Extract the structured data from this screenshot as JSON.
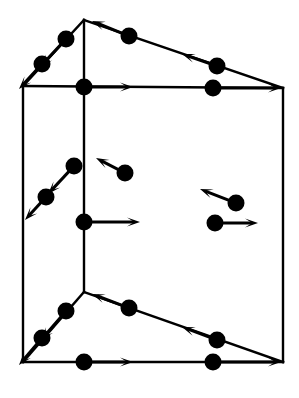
{
  "figure": {
    "type": "line-diagram",
    "width": 299,
    "height": 398,
    "background_color": "#ffffff",
    "stroke_color": "#000000",
    "node_color": "#000000",
    "edge_stroke_width": 2.4,
    "node_radius": 8.5,
    "arrow_head_length": 13,
    "arrow_head_width": 9
  },
  "vertices": [
    {
      "name": "top-apex",
      "x": 84,
      "y": 20
    },
    {
      "name": "top-left-corner",
      "x": 23,
      "y": 86
    },
    {
      "name": "top-right-corner",
      "x": 283,
      "y": 88
    },
    {
      "name": "bottom-apex",
      "x": 84,
      "y": 292
    },
    {
      "name": "bottom-left-corner",
      "x": 23,
      "y": 362
    },
    {
      "name": "bottom-right-corner",
      "x": 283,
      "y": 362
    }
  ],
  "edges": [
    {
      "name": "edge-top-apex-to-top-left",
      "from": "top-apex",
      "to": "top-left-corner",
      "x1": 84,
      "y1": 20,
      "x2": 23,
      "y2": 86,
      "direction": "down-left",
      "midpoint_vectors": [
        {
          "name": "node-top-left-upper",
          "dot_x": 66,
          "dot_y": 39,
          "tip_x": 40,
          "tip_y": 67
        },
        {
          "name": "node-top-left-lower",
          "dot_x": 42,
          "dot_y": 64,
          "tip_x": 19,
          "tip_y": 89
        }
      ]
    },
    {
      "name": "edge-top-right-to-top-apex",
      "from": "top-right-corner",
      "to": "top-apex",
      "x1": 283,
      "y1": 88,
      "x2": 84,
      "y2": 20,
      "direction": "up-left",
      "midpoint_vectors": [
        {
          "name": "node-top-right-inner",
          "dot_x": 129,
          "dot_y": 36,
          "tip_x": 92,
          "tip_y": 21
        },
        {
          "name": "node-top-right-outer",
          "dot_x": 217,
          "dot_y": 66,
          "tip_x": 182,
          "tip_y": 54
        }
      ]
    },
    {
      "name": "edge-top-left-to-top-right",
      "from": "top-left-corner",
      "to": "top-right-corner",
      "x1": 23,
      "y1": 86,
      "x2": 283,
      "y2": 88,
      "direction": "right",
      "midpoint_vectors": [
        {
          "name": "node-top-front-left",
          "dot_x": 84,
          "dot_y": 87,
          "tip_x": 133,
          "tip_y": 87
        },
        {
          "name": "node-top-front-right",
          "dot_x": 213,
          "dot_y": 88,
          "tip_x": 281,
          "tip_y": 88
        }
      ]
    },
    {
      "name": "edge-bottom-apex-to-bottom-left",
      "from": "bottom-apex",
      "to": "bottom-left-corner",
      "x1": 84,
      "y1": 292,
      "x2": 23,
      "y2": 362,
      "direction": "down-left",
      "midpoint_vectors": [
        {
          "name": "node-bottom-left-upper",
          "dot_x": 66,
          "dot_y": 311,
          "tip_x": 41,
          "tip_y": 340
        },
        {
          "name": "node-bottom-left-lower",
          "dot_x": 42,
          "dot_y": 338,
          "tip_x": 19,
          "tip_y": 365
        }
      ]
    },
    {
      "name": "edge-bottom-right-to-bottom-apex",
      "from": "bottom-right-corner",
      "to": "bottom-apex",
      "x1": 283,
      "y1": 362,
      "x2": 84,
      "y2": 292,
      "direction": "up-left",
      "midpoint_vectors": [
        {
          "name": "node-bottom-right-inner",
          "dot_x": 129,
          "dot_y": 308,
          "tip_x": 92,
          "tip_y": 294
        },
        {
          "name": "node-bottom-right-outer",
          "dot_x": 217,
          "dot_y": 340,
          "tip_x": 182,
          "tip_y": 327
        }
      ]
    },
    {
      "name": "edge-bottom-left-to-bottom-right",
      "from": "bottom-left-corner",
      "to": "bottom-right-corner",
      "x1": 23,
      "y1": 362,
      "x2": 283,
      "y2": 362,
      "direction": "right",
      "midpoint_vectors": [
        {
          "name": "node-bottom-front-left",
          "dot_x": 84,
          "dot_y": 362,
          "tip_x": 133,
          "tip_y": 362
        },
        {
          "name": "node-bottom-front-right",
          "dot_x": 213,
          "dot_y": 362,
          "tip_x": 281,
          "tip_y": 362
        }
      ]
    },
    {
      "name": "edge-vertical-apex",
      "from": "top-apex",
      "to": "bottom-apex",
      "x1": 84,
      "y1": 20,
      "x2": 84,
      "y2": 292,
      "direction": "none",
      "midpoint_vectors": [
        {
          "name": "node-vertical-midpoint",
          "dot_x": 84,
          "dot_y": 222,
          "tip_x": 140,
          "tip_y": 222
        }
      ]
    },
    {
      "name": "edge-vertical-left",
      "from": "top-left-corner",
      "to": "bottom-left-corner",
      "x1": 23,
      "y1": 86,
      "x2": 23,
      "y2": 362,
      "direction": "none",
      "midpoint_vectors": []
    },
    {
      "name": "edge-vertical-right",
      "from": "top-right-corner",
      "to": "bottom-right-corner",
      "x1": 283,
      "y1": 88,
      "x2": 283,
      "y2": 362,
      "direction": "none",
      "midpoint_vectors": []
    }
  ],
  "free_vectors": [
    {
      "name": "free-vector-left-face-upper",
      "dot_x": 74,
      "dot_y": 166,
      "tip_x": 48,
      "tip_y": 194,
      "direction": "down-left"
    },
    {
      "name": "free-vector-left-face-lower",
      "dot_x": 46,
      "dot_y": 197,
      "tip_x": 25,
      "tip_y": 220,
      "direction": "down-left"
    },
    {
      "name": "free-vector-front-face-upper",
      "dot_x": 125,
      "dot_y": 173,
      "tip_x": 96,
      "tip_y": 158,
      "direction": "up-left"
    },
    {
      "name": "free-vector-right-face-upper",
      "dot_x": 236,
      "dot_y": 203,
      "tip_x": 200,
      "tip_y": 189,
      "direction": "up-left"
    },
    {
      "name": "free-vector-right-face-lower",
      "dot_x": 215,
      "dot_y": 223,
      "tip_x": 258,
      "tip_y": 223,
      "direction": "right"
    }
  ]
}
